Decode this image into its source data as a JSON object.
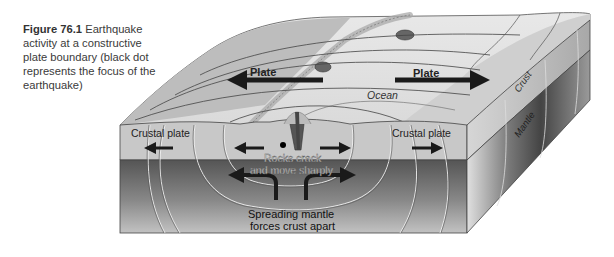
{
  "caption": {
    "figure_number": "Figure 76.1",
    "text": " Earthquake activity at a constructive plate boundary (black dot represents the focus of the earthquake)"
  },
  "labels": {
    "plate_left": "Plate",
    "plate_right": "Plate",
    "ocean": "Ocean",
    "crustal_plate_left": "Crustal plate",
    "crustal_plate_right": "Crustal plate",
    "rocks_crack_line1": "Rocks crack",
    "rocks_crack_line2": "and move sharply",
    "spreading_line1": "Spreading mantle",
    "spreading_line2": "forces crust apart",
    "crust": "Crust",
    "mantle": "Mantle"
  },
  "colors": {
    "background": "#ffffff",
    "crust_front": "#c9c9c9",
    "mantle_dark": "#5a5a5a",
    "mantle_light": "#b5b5b5",
    "top_surface": "#dcdcdc",
    "land": "#bdbdbd",
    "arrow": "#1a1a1a"
  }
}
